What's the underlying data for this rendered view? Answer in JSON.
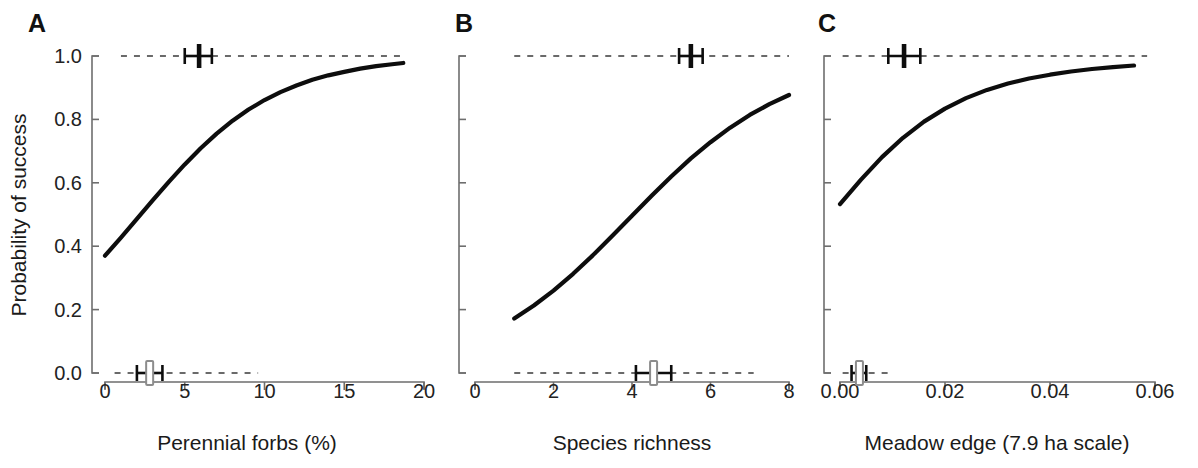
{
  "figure": {
    "background_color": "#ffffff",
    "curve_color": "#0d0d0d",
    "axis_color": "#6e6e6e",
    "rug_color": "#3a3a3a",
    "width": 1198,
    "height": 468,
    "shared_ylabel": "Probability of success"
  },
  "chart_data": [
    {
      "type": "line",
      "panel": "A",
      "title": "",
      "xlabel": "Perennial forbs (%)",
      "ylabel": "Probability of success",
      "xlim": [
        0,
        20
      ],
      "ylim": [
        0.0,
        1.0
      ],
      "grid": false,
      "legend": "none",
      "xticks": [
        0,
        5,
        10,
        15,
        20
      ],
      "xticklabels": [
        "0",
        "5",
        "10",
        "15",
        "20"
      ],
      "yticks": [
        0.0,
        0.2,
        0.4,
        0.6,
        0.8,
        1.0
      ],
      "yticklabels": [
        "0.0",
        "0.2",
        "0.4",
        "0.6",
        "0.8",
        "1.0"
      ],
      "series": [
        {
          "name": "logistic fit",
          "x": [
            0.0,
            1.0,
            2.0,
            3.0,
            4.0,
            5.0,
            6.0,
            7.0,
            8.0,
            9.0,
            10.0,
            11.0,
            12.0,
            13.0,
            14.0,
            15.0,
            16.0,
            17.0,
            18.0,
            18.7
          ],
          "y": [
            0.37,
            0.427,
            0.486,
            0.545,
            0.603,
            0.658,
            0.709,
            0.755,
            0.796,
            0.831,
            0.861,
            0.886,
            0.907,
            0.925,
            0.939,
            0.95,
            0.96,
            0.968,
            0.974,
            0.978
          ]
        }
      ],
      "annotations": {
        "rug_top": {
          "y": 1.0,
          "x_start": 1.0,
          "x_end": 18.7,
          "group": "success",
          "mean": 5.9,
          "lower": 5.0,
          "upper": 6.7,
          "marker": "filled"
        },
        "rug_bottom": {
          "y": 0.0,
          "x_start": 0.6,
          "x_end": 9.6,
          "group": "failure",
          "mean": 2.8,
          "lower": 2.0,
          "upper": 3.6,
          "marker": "open"
        }
      }
    },
    {
      "type": "line",
      "panel": "B",
      "title": "",
      "xlabel": "Species richness",
      "ylabel": "Probability of success",
      "xlim": [
        0,
        8
      ],
      "ylim": [
        0.0,
        1.0
      ],
      "grid": false,
      "legend": "none",
      "xticks": [
        0,
        2,
        4,
        6,
        8
      ],
      "xticklabels": [
        "0",
        "2",
        "4",
        "6",
        "8"
      ],
      "yticks": [
        0.0,
        0.2,
        0.4,
        0.6,
        0.8,
        1.0
      ],
      "yticklabels": [
        "",
        "",
        "",
        "",
        "",
        ""
      ],
      "series": [
        {
          "name": "logistic fit",
          "x": [
            1.0,
            1.5,
            2.0,
            2.5,
            3.0,
            3.5,
            4.0,
            4.5,
            5.0,
            5.5,
            6.0,
            6.5,
            7.0,
            7.5,
            8.0
          ],
          "y": [
            0.172,
            0.213,
            0.26,
            0.313,
            0.371,
            0.433,
            0.496,
            0.559,
            0.62,
            0.677,
            0.728,
            0.774,
            0.814,
            0.848,
            0.877
          ]
        }
      ],
      "annotations": {
        "rug_top": {
          "y": 1.0,
          "x_start": 1.0,
          "x_end": 8.0,
          "group": "success",
          "mean": 5.5,
          "lower": 5.2,
          "upper": 5.8,
          "marker": "filled"
        },
        "rug_bottom": {
          "y": 0.0,
          "x_start": 1.0,
          "x_end": 7.1,
          "group": "failure",
          "mean": 4.55,
          "lower": 4.1,
          "upper": 5.0,
          "marker": "open"
        }
      }
    },
    {
      "type": "line",
      "panel": "C",
      "title": "",
      "xlabel": "Meadow edge (7.9 ha scale)",
      "ylabel": "Probability of success",
      "xlim": [
        0.0,
        0.06
      ],
      "ylim": [
        0.0,
        1.0
      ],
      "grid": false,
      "legend": "none",
      "xticks": [
        0.0,
        0.02,
        0.04,
        0.06
      ],
      "xticklabels": [
        "0.00",
        "0.02",
        "0.04",
        "0.06"
      ],
      "yticks": [
        0.0,
        0.2,
        0.4,
        0.6,
        0.8,
        1.0
      ],
      "yticklabels": [
        "",
        "",
        "",
        "",
        "",
        ""
      ],
      "series": [
        {
          "name": "logistic fit",
          "x": [
            0.0,
            0.004,
            0.008,
            0.012,
            0.016,
            0.02,
            0.024,
            0.028,
            0.032,
            0.036,
            0.04,
            0.044,
            0.048,
            0.052,
            0.056
          ],
          "y": [
            0.533,
            0.61,
            0.681,
            0.742,
            0.793,
            0.834,
            0.867,
            0.893,
            0.913,
            0.929,
            0.941,
            0.951,
            0.959,
            0.965,
            0.97
          ]
        }
      ],
      "annotations": {
        "rug_top": {
          "y": 1.0,
          "x_start": 0.0005,
          "x_end": 0.0585,
          "group": "success",
          "mean": 0.0122,
          "lower": 0.0092,
          "upper": 0.0153,
          "marker": "filled"
        },
        "rug_bottom": {
          "y": 0.0,
          "x_start": 0.0005,
          "x_end": 0.0096,
          "group": "failure",
          "mean": 0.0037,
          "lower": 0.0022,
          "upper": 0.005,
          "marker": "open"
        }
      }
    }
  ],
  "panels": [
    {
      "letter": "A",
      "xlabel": "Perennial forbs (%)"
    },
    {
      "letter": "B",
      "xlabel": "Species richness"
    },
    {
      "letter": "C",
      "xlabel": "Meadow edge (7.9 ha scale)"
    }
  ]
}
